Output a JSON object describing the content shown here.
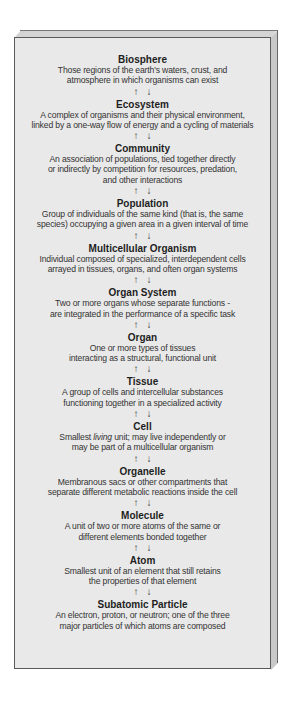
{
  "diagram": {
    "arrow_up": "↑",
    "arrow_down": "↓",
    "levels": [
      {
        "name": "Biosphere",
        "desc": "Those regions of the earth's waters, crust, and\natmosphere in which organisms can exist"
      },
      {
        "name": "Ecosystem",
        "desc": "A complex of organisms and their physical environment,\nlinked by a one-way flow of energy and a cycling of materials"
      },
      {
        "name": "Community",
        "desc": "An association of populations, tied together directly\nor indirectly by competition for resources, predation,\nand other interactions"
      },
      {
        "name": "Population",
        "desc": "Group of individuals of the same kind (that is, the same\nspecies) occupying a given area in a given interval of time"
      },
      {
        "name": "Multicellular Organism",
        "desc": "Individual composed of specialized, interdependent cells\narrayed in tissues, organs, and often organ systems"
      },
      {
        "name": "Organ System",
        "desc": "Two or more organs whose separate functions -\nare integrated in the performance of a specific task"
      },
      {
        "name": "Organ",
        "desc": "One or more types of tissues\ninteracting as a structural, functional unit"
      },
      {
        "name": "Tissue",
        "desc": "A group of cells and intercellular substances\nfunctioning together in a specialized activity"
      },
      {
        "name": "Cell",
        "desc_before_italic": "Smallest ",
        "desc_italic": "living",
        "desc_after_italic": " unit; may live independently or\nmay be part of a multicellular organism"
      },
      {
        "name": "Organelle",
        "desc": "Membranous sacs or other compartments that\nseparate different metabolic reactions inside the cell"
      },
      {
        "name": "Molecule",
        "desc": "A unit of two or more atoms of the same or\ndifferent elements bonded together"
      },
      {
        "name": "Atom",
        "desc": "Smallest unit of an element that still retains\nthe properties of that element"
      },
      {
        "name": "Subatomic Particle",
        "desc": "An electron, proton, or neutron; one of the three\nmajor particles of which atoms are composed"
      }
    ]
  }
}
